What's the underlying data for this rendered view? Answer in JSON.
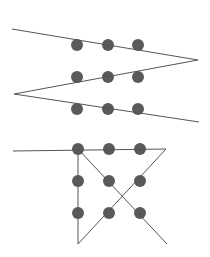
{
  "diagram": {
    "colors": {
      "dot": "#5a5a5a",
      "line": "#555555",
      "background": "#ffffff"
    },
    "dot_radius": 6,
    "line_width": 1,
    "puzzles": [
      {
        "name": "zigzag-solution",
        "dots": [
          [
            77,
            45
          ],
          [
            108,
            45
          ],
          [
            138,
            45
          ],
          [
            77,
            77
          ],
          [
            108,
            77
          ],
          [
            138,
            77
          ],
          [
            77,
            109
          ],
          [
            108,
            109
          ],
          [
            138,
            109
          ]
        ],
        "path": [
          [
            12,
            29
          ],
          [
            198,
            60
          ],
          [
            14,
            94
          ],
          [
            199,
            122
          ]
        ]
      },
      {
        "name": "triangle-solution",
        "dots": [
          [
            78,
            149
          ],
          [
            109,
            149
          ],
          [
            140,
            149
          ],
          [
            78,
            181
          ],
          [
            109,
            181
          ],
          [
            140,
            181
          ],
          [
            78,
            213
          ],
          [
            109,
            213
          ],
          [
            140,
            213
          ]
        ],
        "path": [
          [
            13,
            151
          ],
          [
            166,
            149
          ],
          [
            78,
            244
          ],
          [
            78,
            149
          ],
          [
            167,
            244
          ]
        ]
      }
    ]
  }
}
